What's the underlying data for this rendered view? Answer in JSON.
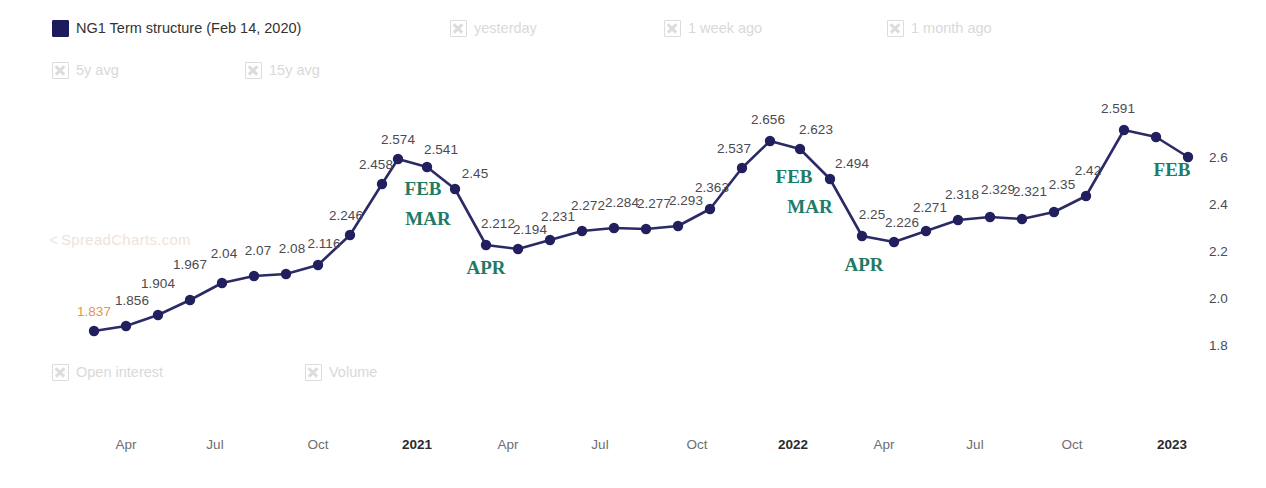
{
  "legend": {
    "row1": [
      {
        "label": "NG1 Term structure (Feb 14, 2020)",
        "state": "filled",
        "active": true
      },
      {
        "label": "yesterday",
        "state": "x",
        "active": false
      },
      {
        "label": "1 week ago",
        "state": "x",
        "active": false
      },
      {
        "label": "1 month ago",
        "state": "x",
        "active": false
      }
    ],
    "row2": [
      {
        "label": "5y avg",
        "state": "x",
        "active": false
      },
      {
        "label": "15y avg",
        "state": "x",
        "active": false
      }
    ],
    "row3": [
      {
        "label": "Open interest",
        "state": "x",
        "active": false
      },
      {
        "label": "Volume",
        "state": "x",
        "active": false
      }
    ]
  },
  "watermark": {
    "arrow": "<",
    "text": "SpreadCharts.com"
  },
  "chart_data": {
    "type": "line",
    "title": "NG1 Term structure (Feb 14, 2020)",
    "xlabel": "",
    "ylabel": "",
    "ylim": [
      1.75,
      2.7
    ],
    "yticks": [
      "2.6",
      "2.4",
      "2.2",
      "2.0",
      "1.8"
    ],
    "ytick_values": [
      2.6,
      2.4,
      2.2,
      2.0,
      1.8
    ],
    "grid": false,
    "legend_position": "top",
    "series_name": "NG1 Term structure (Feb 14, 2020)",
    "line_color": "#2b2a66",
    "marker_color": "#221f5e",
    "first_label_color": "#e8954a",
    "month_label_color": "#1f7a66",
    "xticks": [
      {
        "label": "Apr",
        "bold": false,
        "x": 126
      },
      {
        "label": "Jul",
        "bold": false,
        "x": 215
      },
      {
        "label": "Oct",
        "bold": false,
        "x": 318
      },
      {
        "label": "2021",
        "bold": true,
        "x": 417
      },
      {
        "label": "Apr",
        "bold": false,
        "x": 508
      },
      {
        "label": "Jul",
        "bold": false,
        "x": 600
      },
      {
        "label": "Oct",
        "bold": false,
        "x": 697
      },
      {
        "label": "2022",
        "bold": true,
        "x": 793
      },
      {
        "label": "Apr",
        "bold": false,
        "x": 884
      },
      {
        "label": "Jul",
        "bold": false,
        "x": 975
      },
      {
        "label": "Oct",
        "bold": false,
        "x": 1072
      },
      {
        "label": "2023",
        "bold": true,
        "x": 1172
      }
    ],
    "values": [
      1.837,
      1.856,
      1.904,
      1.967,
      2.04,
      2.07,
      2.08,
      2.116,
      2.246,
      2.458,
      2.574,
      2.541,
      2.45,
      2.212,
      2.194,
      2.231,
      2.272,
      2.284,
      2.277,
      2.293,
      2.363,
      2.537,
      2.656,
      2.623,
      2.494,
      2.25,
      2.226,
      2.271,
      2.318,
      2.329,
      2.321,
      2.35,
      2.42,
      2.591,
      2.62,
      2.6
    ],
    "labels": [
      "1.837",
      "1.856",
      "1.904",
      "1.967",
      "2.04",
      "2.07",
      "2.08",
      "2.116",
      "2.246",
      "2.458",
      "2.574",
      "2.541",
      "2.45",
      "2.212",
      "2.194",
      "2.231",
      "2.272",
      "2.284",
      "2.277",
      "2.293",
      "2.363",
      "2.537",
      "2.656",
      "2.623",
      "2.494",
      "2.25",
      "2.226",
      "2.271",
      "2.318",
      "2.329",
      "2.321",
      "2.35",
      "2.42",
      "2.591",
      "",
      ""
    ],
    "x_pixels": [
      94,
      126,
      158,
      190,
      222,
      254,
      286,
      318,
      350,
      382,
      398,
      427,
      455,
      486,
      518,
      550,
      582,
      614,
      646,
      678,
      710,
      742,
      770,
      800,
      830,
      862,
      894,
      926,
      958,
      990,
      1022,
      1054,
      1086,
      1124,
      1156,
      1188
    ],
    "y_pixels": [
      331,
      326,
      315,
      300,
      283,
      276,
      274,
      265,
      235,
      184,
      159,
      167,
      189,
      245,
      249,
      240,
      231,
      228,
      229,
      226,
      209,
      168,
      141,
      149,
      179,
      236,
      242,
      231,
      220,
      217,
      219,
      212,
      196,
      130,
      137,
      157
    ],
    "month_annotations": [
      {
        "label": "FEB",
        "x": 423,
        "y": 189
      },
      {
        "label": "MAR",
        "x": 428,
        "y": 219
      },
      {
        "label": "APR",
        "x": 486,
        "y": 268
      },
      {
        "label": "FEB",
        "x": 794,
        "y": 177
      },
      {
        "label": "MAR",
        "x": 810,
        "y": 207
      },
      {
        "label": "APR",
        "x": 864,
        "y": 265
      },
      {
        "label": "FEB",
        "x": 1172,
        "y": 170
      }
    ],
    "label_offsets": [
      {
        "dx": 0,
        "dy": -12
      },
      {
        "dx": 6,
        "dy": -18
      },
      {
        "dx": 0,
        "dy": -24
      },
      {
        "dx": 0,
        "dy": -28
      },
      {
        "dx": 2,
        "dy": -22
      },
      {
        "dx": 4,
        "dy": -18
      },
      {
        "dx": 6,
        "dy": -18
      },
      {
        "dx": 6,
        "dy": -14
      },
      {
        "dx": -4,
        "dy": -12
      },
      {
        "dx": -6,
        "dy": -12
      },
      {
        "dx": 0,
        "dy": -12
      },
      {
        "dx": 14,
        "dy": -10
      },
      {
        "dx": 20,
        "dy": -8
      },
      {
        "dx": 12,
        "dy": -14
      },
      {
        "dx": 12,
        "dy": -12
      },
      {
        "dx": 8,
        "dy": -16
      },
      {
        "dx": 6,
        "dy": -18
      },
      {
        "dx": 8,
        "dy": -18
      },
      {
        "dx": 8,
        "dy": -18
      },
      {
        "dx": 8,
        "dy": -18
      },
      {
        "dx": 2,
        "dy": -14
      },
      {
        "dx": -8,
        "dy": -12
      },
      {
        "dx": -2,
        "dy": -14
      },
      {
        "dx": 16,
        "dy": -12
      },
      {
        "dx": 22,
        "dy": -8
      },
      {
        "dx": 10,
        "dy": -14
      },
      {
        "dx": 8,
        "dy": -12
      },
      {
        "dx": 4,
        "dy": -16
      },
      {
        "dx": 4,
        "dy": -18
      },
      {
        "dx": 8,
        "dy": -20
      },
      {
        "dx": 8,
        "dy": -20
      },
      {
        "dx": 8,
        "dy": -20
      },
      {
        "dx": 2,
        "dy": -18
      },
      {
        "dx": -6,
        "dy": -14
      },
      {
        "dx": 0,
        "dy": 0
      },
      {
        "dx": 0,
        "dy": 0
      }
    ]
  }
}
